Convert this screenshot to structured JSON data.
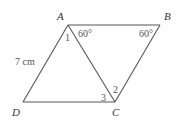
{
  "figure": {
    "type": "parallelogram",
    "vertices": {
      "A": {
        "label": "A",
        "x": 68,
        "y": 25
      },
      "B": {
        "label": "B",
        "x": 160,
        "y": 25
      },
      "C": {
        "label": "C",
        "x": 115,
        "y": 102
      },
      "D": {
        "label": "D",
        "x": 23,
        "y": 102
      }
    },
    "diagonal": "AC",
    "side_label": "7 cm",
    "angle_labels": {
      "angle_1": "1",
      "angle_2": "2",
      "angle_3": "3",
      "angle_at_A": "60°",
      "angle_at_B": "60°"
    }
  }
}
